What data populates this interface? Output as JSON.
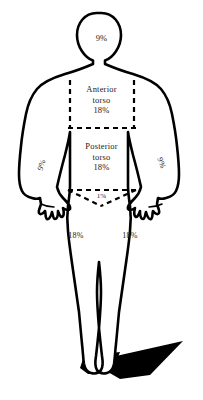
{
  "diagram": {
    "type": "anatomical-body-diagram",
    "view": "anterior full-body silhouette with cast shadow",
    "line_color": "#000000",
    "fill_color": "#ffffff",
    "background_color": "#ffffff",
    "shadow_color": "#000000",
    "regions": {
      "head": {
        "name": "head",
        "percent": "9%"
      },
      "anterior_torso": {
        "name": "Anterior torso",
        "line1": "Anterior",
        "line2": "torso",
        "percent": "18%"
      },
      "posterior_torso": {
        "name": "Posterior torso",
        "line1": "Posterior",
        "line2": "torso",
        "percent": "18%"
      },
      "groin": {
        "name": "groin",
        "percent": "1%"
      },
      "arm_left": {
        "name": "left arm",
        "percent": "9%"
      },
      "arm_right": {
        "name": "right arm",
        "percent": "9%"
      },
      "leg_left": {
        "name": "left leg",
        "percent": "18%"
      },
      "leg_right": {
        "name": "right leg",
        "percent": "18%"
      }
    }
  }
}
